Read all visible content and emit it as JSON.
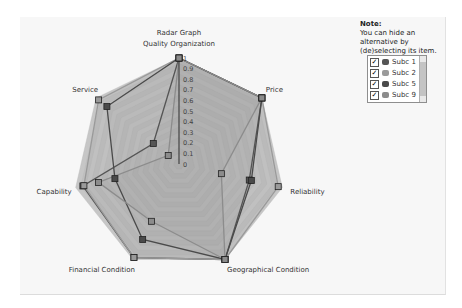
{
  "chart_data": {
    "type": "radar",
    "title": "Radar Graph",
    "axes": [
      "Quality Organization",
      "Price",
      "Reliability",
      "Geographical Condition",
      "Financial Condition",
      "Capability",
      "Service"
    ],
    "scale_ticks": [
      "0",
      "0.1",
      "0.2",
      "0.3",
      "0.4",
      "0.5",
      "0.6",
      "0.7",
      "0.8",
      "0.9",
      "1"
    ],
    "range": [
      0,
      1
    ],
    "series": [
      {
        "name": "Subc 1",
        "color": "#555555",
        "values": [
          1.0,
          1.0,
          0.68,
          1.0,
          0.98,
          0.93,
          0.31
        ]
      },
      {
        "name": "Subc 2",
        "color": "#9a9a9a",
        "values": [
          1.0,
          1.0,
          0.96,
          1.0,
          0.98,
          0.92,
          0.97
        ]
      },
      {
        "name": "Subc 5",
        "color": "#4a4a4a",
        "values": [
          1.0,
          1.0,
          0.7,
          1.0,
          0.79,
          0.62,
          0.87
        ]
      },
      {
        "name": "Subc 9",
        "color": "#8c8c8c",
        "values": [
          1.0,
          1.0,
          0.41,
          1.0,
          0.6,
          0.78,
          0.13
        ]
      }
    ],
    "legend_position": "right"
  },
  "note": {
    "title": "Note:",
    "text": "You can hide an alternative by (de)selecting its item."
  },
  "legend": {
    "items": [
      {
        "label": "Subc 1",
        "checked": true,
        "color": "#555555"
      },
      {
        "label": "Subc 2",
        "checked": true,
        "color": "#9a9a9a"
      },
      {
        "label": "Subc 5",
        "checked": true,
        "color": "#4a4a4a"
      },
      {
        "label": "Subc 9",
        "checked": true,
        "color": "#8c8c8c"
      }
    ],
    "check_glyph": "✓"
  }
}
